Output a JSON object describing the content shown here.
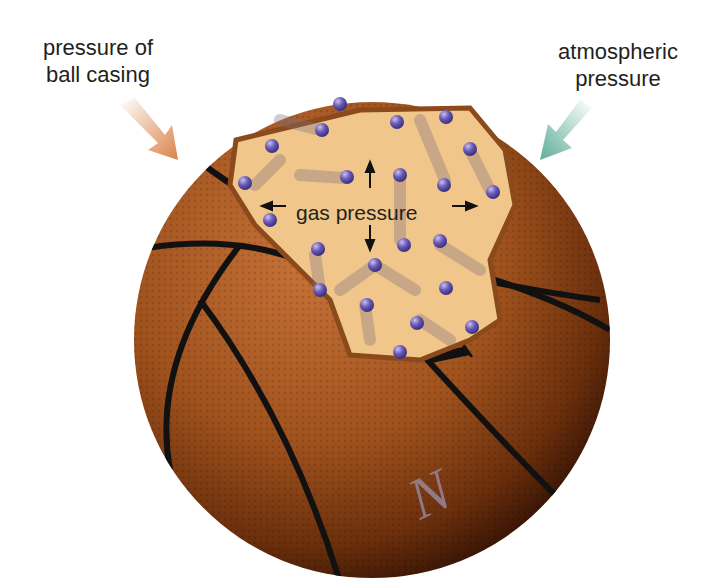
{
  "diagram": {
    "labels": {
      "casing": "pressure of ball casing",
      "casing_line1": "pressure of",
      "casing_line2": "ball casing",
      "atmospheric_line1": "atmospheric",
      "atmospheric_line2": "pressure",
      "gas": "gas pressure"
    },
    "ball_brand_text": "VICT",
    "ball_secondary_text": "N",
    "colors": {
      "ball": "#a0521d",
      "ball_dark": "#4a1e06",
      "seams": "#111111",
      "cutaway_interior": "#f1c68a",
      "molecules": "#6b5bb5",
      "casing_arrow": "#d9834a",
      "atmospheric_arrow": "#5fae97"
    }
  }
}
